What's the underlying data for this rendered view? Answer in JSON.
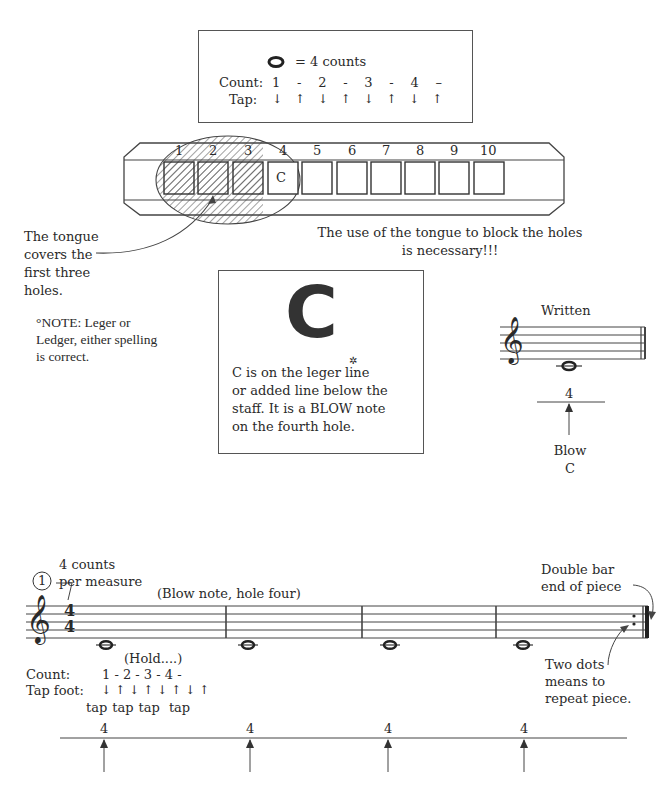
{
  "legend_box": {
    "note_symbol": "whole-note",
    "equals_text": "= 4 counts",
    "count_label": "Count:",
    "counts": [
      "1",
      "-",
      "2",
      "-",
      "3",
      "-",
      "4",
      "–"
    ],
    "tap_label": "Tap:",
    "taps": [
      "↓",
      "↑",
      "↓",
      "↑",
      "↓",
      "↑",
      "↓",
      "↑"
    ]
  },
  "harmonica": {
    "holes": [
      "1",
      "2",
      "3",
      "4",
      "5",
      "6",
      "7",
      "8",
      "9",
      "10"
    ],
    "blocked_holes": [
      "1",
      "2",
      "3"
    ],
    "highlight_hole": "4",
    "highlight_label": "C"
  },
  "tongue_note": "The tongue covers the first three holes.",
  "tongue_lines": [
    "The tongue",
    "covers the",
    "first three",
    "holes."
  ],
  "block_note_lines": [
    "The use of the tongue to block the holes",
    "is necessary!!!"
  ],
  "leger_note": {
    "lines": [
      "°NOTE: Leger or",
      "Ledger, either spelling",
      "is correct."
    ]
  },
  "c_box": {
    "big_letter": "C",
    "lines": [
      "C is on the leger line",
      "or added line below the",
      "staff. It is a BLOW note",
      "on the fourth hole."
    ]
  },
  "written_example": {
    "title": "Written",
    "hole_number": "4",
    "action_lines": [
      "Blow",
      "C"
    ]
  },
  "exercise": {
    "number": "1",
    "time_sig_note_lines": [
      "4 counts",
      "per measure"
    ],
    "time_signature": [
      "4",
      "4"
    ],
    "blow_note_label": "(Blow note, hole four)",
    "hold_label": "(Hold....)",
    "count_label": "Count:",
    "counts": "1 - 2 - 3 - 4 -",
    "tap_label": "Tap foot:",
    "taps": [
      "↓",
      "↑",
      "↓",
      "↑",
      "↓",
      "↑",
      "↓",
      "↑"
    ],
    "tap_words": [
      "tap",
      "tap",
      "tap",
      "tap"
    ],
    "double_bar_lines": [
      "Double bar",
      "end of piece"
    ],
    "repeat_lines": [
      "Two dots",
      "means to",
      "repeat piece."
    ],
    "hole_markers": [
      "4",
      "4",
      "4",
      "4"
    ]
  }
}
